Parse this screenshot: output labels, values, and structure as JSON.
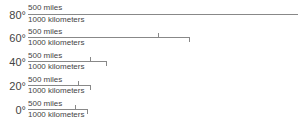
{
  "scales": [
    {
      "latitude": "80°",
      "miles_label": "500 miles",
      "km_label": "1000 kilometers",
      "mi_x": 298,
      "km_x": 298
    },
    {
      "latitude": "60°",
      "miles_label": "500 miles",
      "km_label": "1000 kilometers",
      "mi_x": 158,
      "km_x": 189
    },
    {
      "latitude": "40°",
      "miles_label": "500 miles",
      "km_label": "1000 kilometers",
      "mi_x": 90,
      "km_x": 106
    },
    {
      "latitude": "20°",
      "miles_label": "500 miles",
      "km_label": "1000 kilometers",
      "mi_x": 78,
      "km_x": 90
    },
    {
      "latitude": "0°",
      "miles_label": "500 miles",
      "km_label": "1000 kilometers",
      "mi_x": 75,
      "km_x": 87
    }
  ]
}
